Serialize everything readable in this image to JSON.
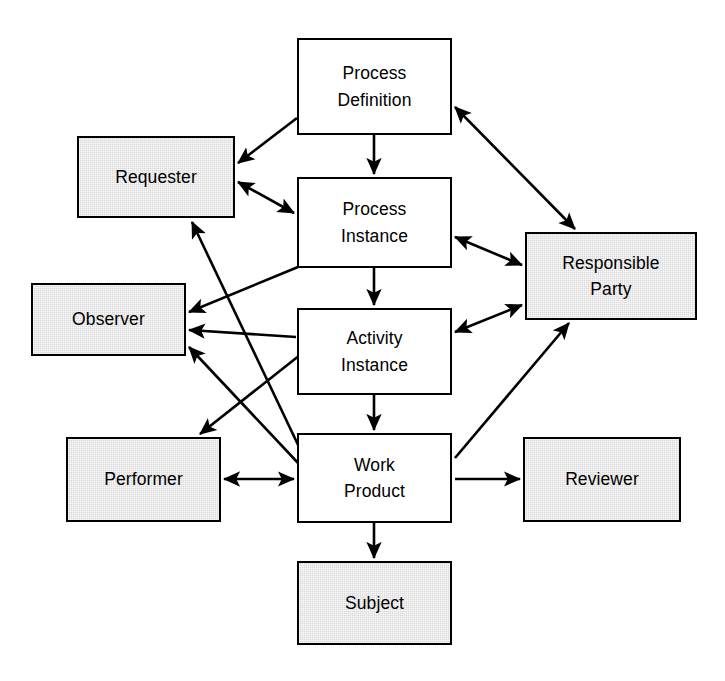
{
  "diagram": {
    "canvas": {
      "width": 725,
      "height": 681
    },
    "colors": {
      "stroke": "#000000",
      "plain_fill": "#ffffff",
      "shaded_fill": "#d9d9d9",
      "background": "#ffffff"
    },
    "nodes": [
      {
        "id": "process-definition",
        "label": "Process Definition",
        "lines": [
          "Process",
          "Definition"
        ],
        "shaded": false,
        "x": 297,
        "y": 38,
        "w": 155,
        "h": 97
      },
      {
        "id": "requester",
        "label": "Requester",
        "lines": [
          "Requester"
        ],
        "shaded": true,
        "x": 77,
        "y": 136,
        "w": 158,
        "h": 82
      },
      {
        "id": "process-instance",
        "label": "Process Instance",
        "lines": [
          "Process",
          "Instance"
        ],
        "shaded": false,
        "x": 297,
        "y": 177,
        "w": 155,
        "h": 91
      },
      {
        "id": "responsible-party",
        "label": "Responsible Party",
        "lines": [
          "Responsible",
          "Party"
        ],
        "shaded": true,
        "x": 525,
        "y": 232,
        "w": 172,
        "h": 88
      },
      {
        "id": "observer",
        "label": "Observer",
        "lines": [
          "Observer"
        ],
        "shaded": true,
        "x": 31,
        "y": 283,
        "w": 155,
        "h": 73
      },
      {
        "id": "activity-instance",
        "label": "Activity Instance",
        "lines": [
          "Activity",
          "Instance"
        ],
        "shaded": false,
        "x": 297,
        "y": 308,
        "w": 155,
        "h": 87
      },
      {
        "id": "performer",
        "label": "Performer",
        "lines": [
          "Performer"
        ],
        "shaded": true,
        "x": 66,
        "y": 437,
        "w": 155,
        "h": 85
      },
      {
        "id": "work-product",
        "label": "Work Product",
        "lines": [
          "Work",
          "Product"
        ],
        "shaded": false,
        "x": 297,
        "y": 433,
        "w": 155,
        "h": 90
      },
      {
        "id": "reviewer",
        "label": "Reviewer",
        "lines": [
          "Reviewer"
        ],
        "shaded": true,
        "x": 523,
        "y": 437,
        "w": 158,
        "h": 85
      },
      {
        "id": "subject",
        "label": "Subject",
        "lines": [
          "Subject"
        ],
        "shaded": true,
        "x": 297,
        "y": 561,
        "w": 155,
        "h": 84
      }
    ],
    "edges": [
      {
        "id": "edge-pd-req",
        "from": "process-definition",
        "to": "requester",
        "direction": "one-way",
        "x1": 297,
        "y1": 118,
        "x2": 238,
        "y2": 163
      },
      {
        "id": "edge-pd-pi",
        "from": "process-definition",
        "to": "process-instance",
        "direction": "one-way",
        "x1": 374,
        "y1": 135,
        "x2": 374,
        "y2": 174
      },
      {
        "id": "edge-pd-rp",
        "from": "process-definition",
        "to": "responsible-party",
        "direction": "two-way",
        "x1": 455,
        "y1": 107,
        "x2": 575,
        "y2": 229
      },
      {
        "id": "edge-req-pi",
        "from": "requester",
        "to": "process-instance",
        "direction": "two-way",
        "x1": 238,
        "y1": 182,
        "x2": 294,
        "y2": 213
      },
      {
        "id": "edge-pi-rp",
        "from": "process-instance",
        "to": "responsible-party",
        "direction": "two-way",
        "x1": 455,
        "y1": 237,
        "x2": 522,
        "y2": 265
      },
      {
        "id": "edge-pi-obs",
        "from": "process-instance",
        "to": "observer",
        "direction": "one-way",
        "x1": 298,
        "y1": 267,
        "x2": 189,
        "y2": 312
      },
      {
        "id": "edge-pi-ai",
        "from": "process-instance",
        "to": "activity-instance",
        "direction": "one-way",
        "x1": 374,
        "y1": 268,
        "x2": 374,
        "y2": 305
      },
      {
        "id": "edge-ai-obs",
        "from": "activity-instance",
        "to": "observer",
        "direction": "one-way",
        "x1": 296,
        "y1": 337,
        "x2": 189,
        "y2": 330
      },
      {
        "id": "edge-ai-rp",
        "from": "activity-instance",
        "to": "responsible-party",
        "direction": "two-way",
        "x1": 455,
        "y1": 332,
        "x2": 522,
        "y2": 305
      },
      {
        "id": "edge-ai-perf",
        "from": "activity-instance",
        "to": "performer",
        "direction": "one-way",
        "x1": 300,
        "y1": 355,
        "x2": 200,
        "y2": 434
      },
      {
        "id": "edge-ai-wp",
        "from": "activity-instance",
        "to": "work-product",
        "direction": "one-way",
        "x1": 374,
        "y1": 395,
        "x2": 374,
        "y2": 430
      },
      {
        "id": "edge-wp-obs",
        "from": "work-product",
        "to": "observer",
        "direction": "one-way",
        "x1": 299,
        "y1": 464,
        "x2": 189,
        "y2": 347
      },
      {
        "id": "edge-wp-req",
        "from": "work-product",
        "to": "requester",
        "direction": "one-way",
        "x1": 310,
        "y1": 470,
        "x2": 192,
        "y2": 222
      },
      {
        "id": "edge-perf-wp",
        "from": "performer",
        "to": "work-product",
        "direction": "two-way",
        "x1": 224,
        "y1": 479,
        "x2": 294,
        "y2": 479
      },
      {
        "id": "edge-wp-rev",
        "from": "work-product",
        "to": "reviewer",
        "direction": "one-way",
        "x1": 455,
        "y1": 479,
        "x2": 520,
        "y2": 479
      },
      {
        "id": "edge-wp-rp",
        "from": "work-product",
        "to": "responsible-party",
        "direction": "one-way",
        "x1": 455,
        "y1": 458,
        "x2": 569,
        "y2": 323
      },
      {
        "id": "edge-wp-subj",
        "from": "work-product",
        "to": "subject",
        "direction": "one-way",
        "x1": 374,
        "y1": 523,
        "x2": 374,
        "y2": 558
      }
    ],
    "caption": ""
  }
}
